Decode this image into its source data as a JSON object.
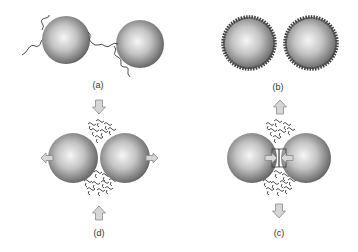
{
  "figure": {
    "panels": [
      {
        "id": "a",
        "label": "(a)",
        "description": "two spheres with grafted polymer chains"
      },
      {
        "id": "b",
        "label": "(b)",
        "description": "two spheres with dense adsorbed coating"
      },
      {
        "id": "c",
        "label": "(c)",
        "description": "spheres bridged with ligand bond in gap, surrounded by free coils"
      },
      {
        "id": "d",
        "label": "(d)",
        "description": "spheres pushed together, free coils in gap, lateral arrows"
      }
    ],
    "colors": {
      "sphere_light": "#f4f4f4",
      "sphere_mid": "#a8a8a8",
      "sphere_dark": "#5a5a5a",
      "arrow_fill": "#d6d6d6",
      "arrow_stroke": "#8a8a8a",
      "chain": "#3a3a3a"
    }
  }
}
